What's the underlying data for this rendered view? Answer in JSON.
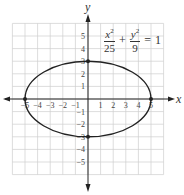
{
  "chart_data": {
    "type": "line",
    "title": "",
    "equation": {
      "term1_num": "x",
      "term1_num_exp": "2",
      "term1_den": "25",
      "plus": "+",
      "term2_num": "y",
      "term2_num_exp": "2",
      "term2_den": "9",
      "equals": "=",
      "rhs": "1"
    },
    "xlabel": "x",
    "ylabel": "y",
    "xlim": [
      -6,
      6
    ],
    "ylim": [
      -6,
      6
    ],
    "grid": true,
    "x_ticks": [
      "−5",
      "−4",
      "−3",
      "−2",
      "−1",
      "1",
      "2",
      "3",
      "4",
      "5"
    ],
    "y_ticks": [
      "5",
      "4",
      "3",
      "2",
      "1",
      "−1",
      "−2",
      "−3",
      "−4",
      "−5"
    ],
    "series": [
      {
        "name": "ellipse x^2/25 + y^2/9 = 1",
        "shape": "ellipse",
        "center": [
          0,
          0
        ],
        "semi_major_x": 5,
        "semi_minor_y": 3
      }
    ],
    "points": [
      {
        "x": -5,
        "y": 0
      },
      {
        "x": 5,
        "y": 0
      },
      {
        "x": 0,
        "y": 3
      },
      {
        "x": 0,
        "y": -3
      }
    ]
  }
}
